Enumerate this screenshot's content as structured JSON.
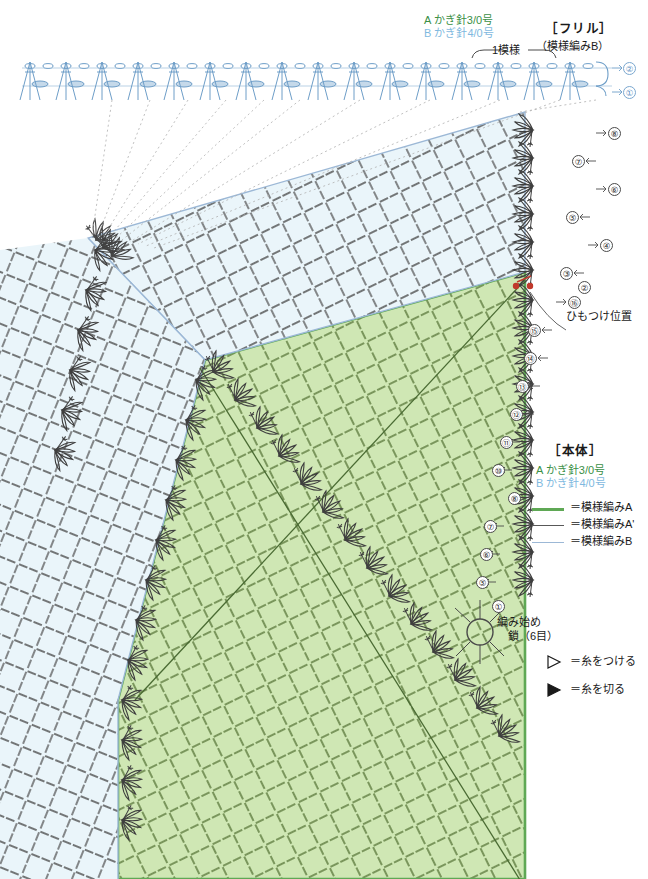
{
  "frill": {
    "hook_a": "A かぎ針3/0号",
    "hook_b": "B かぎ針4/0号",
    "section_title": "［フリル］",
    "section_sub": "（模様編みB）",
    "repeat_label": "1模様",
    "rows": [
      "②",
      "①"
    ]
  },
  "body": {
    "section_title": "［本体］",
    "hook_a": "A かぎ針3/0号",
    "hook_b": "B かぎ針4/0号",
    "legend": [
      {
        "label": "＝模様編みA",
        "color": "#5fa855"
      },
      {
        "label": "＝模様編みA'",
        "color": "#585858"
      },
      {
        "label": "＝模様編みB",
        "color": "#9cb8d6"
      }
    ],
    "cord_note": "ひもつけ位置",
    "start_note_line1": "編み始め",
    "start_note_line2": "鎖（6目）"
  },
  "symbols": {
    "attach_yarn": "＝糸をつける",
    "cut_yarn": "＝糸を切る",
    "attach_icon": "open-triangle",
    "cut_icon": "filled-triangle"
  },
  "row_numbers_upper": [
    "⑧",
    "⑦",
    "⑥",
    "⑤",
    "④",
    "③",
    "②",
    "①"
  ],
  "row_numbers_middle": [
    "⑯",
    "⑮",
    "⑭",
    "⑬",
    "⑫",
    "⑪",
    "⑩"
  ],
  "row_numbers_lower": [
    "⑨",
    "⑧",
    "⑦",
    "⑥",
    "⑤",
    "④",
    "③",
    "②",
    "①"
  ],
  "colors": {
    "panel_green": "#cfe7b4",
    "panel_blue": "#e8f4f8",
    "stitch_dark": "#3f3f3f",
    "stitch_blue": "#6e9ec8",
    "stitch_green_outline": "#5c7b3c",
    "accent_red": "#c0392b"
  }
}
